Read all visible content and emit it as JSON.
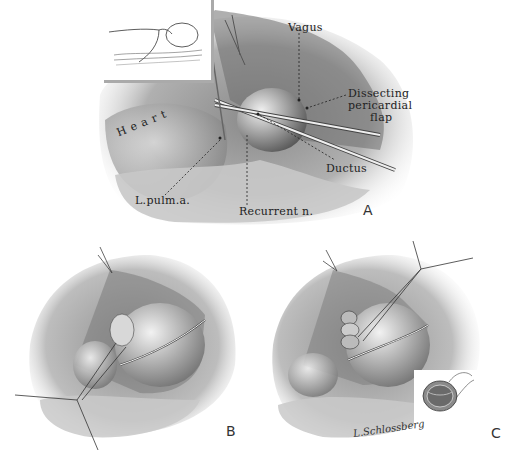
{
  "figure": {
    "panels": [
      {
        "id": "A",
        "letter": "A",
        "description": "Exposure of ductus with dissecting pericardial flap",
        "labels": {
          "heart": "Heart",
          "vagus": "Vagus",
          "dissecting_line1": "Dissecting",
          "dissecting_line2": "pericardial",
          "dissecting_line3": "flap",
          "ductus": "Ductus",
          "pulm": "L.pulm.a.",
          "recurrent": "Recurrent n."
        }
      },
      {
        "id": "B",
        "letter": "B",
        "description": "Traction sutures placed on ductus"
      },
      {
        "id": "C",
        "letter": "C",
        "description": "Ligation of ductus with inset cross-section"
      }
    ],
    "inset_A": "Infant positioning sketch",
    "inset_C": "Ductus cross-section",
    "signature": "L.Schlossberg",
    "colors": {
      "tissue_dark": "#5a5a5a",
      "tissue_mid": "#9a9a9a",
      "tissue_light": "#d4d4d4",
      "ink": "#222222",
      "background": "#ffffff"
    }
  }
}
